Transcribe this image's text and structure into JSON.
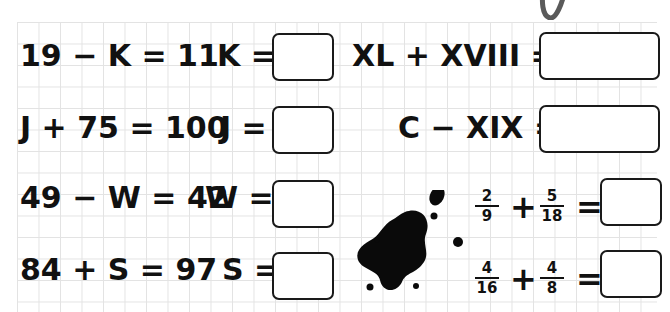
{
  "worksheet": {
    "left_column": [
      {
        "equation": "19 − K = 11",
        "answer_label": "K =",
        "answer_value": ""
      },
      {
        "equation": "J + 75 = 100",
        "answer_label": "J =",
        "answer_value": ""
      },
      {
        "equation": "49 − W = 42",
        "answer_label": "W =",
        "answer_value": ""
      },
      {
        "equation": "84 + S = 97",
        "answer_label": "S =",
        "answer_value": ""
      }
    ],
    "right_column": [
      {
        "expression": "XL + XVIII =",
        "answer_value": ""
      },
      {
        "expression": "C − XIX =",
        "answer_value": ""
      }
    ],
    "fractions": [
      {
        "a_num": "2",
        "a_den": "9",
        "operator": "+",
        "b_num": "5",
        "b_den": "18",
        "equals": "=",
        "answer_value": ""
      },
      {
        "a_num": "4",
        "a_den": "16",
        "operator": "+",
        "b_num": "4",
        "b_den": "8",
        "equals": "=",
        "answer_value": ""
      }
    ]
  },
  "decorations": {
    "ink_blot": "ink-blot",
    "pencil_mark": "pencil-stroke"
  },
  "colors": {
    "grid_line": "#e3e3e3",
    "ink": "#111111",
    "pencil": "#555555"
  }
}
